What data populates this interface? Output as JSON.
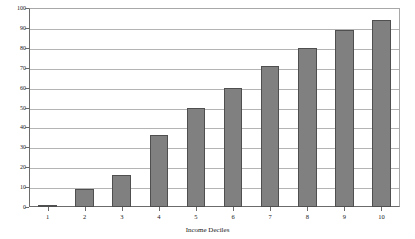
{
  "chart_data": {
    "type": "bar",
    "title": "",
    "subtitle": "",
    "xlabel": "Income Deciles",
    "ylabel": "",
    "categories": [
      "1",
      "2",
      "3",
      "4",
      "5",
      "6",
      "7",
      "8",
      "9",
      "10"
    ],
    "values": [
      1,
      9,
      16,
      36,
      50,
      60,
      71,
      80,
      89,
      94
    ],
    "series": [
      {
        "name": "",
        "values": [
          1,
          9,
          16,
          36,
          50,
          60,
          71,
          80,
          89,
          94
        ]
      }
    ],
    "ylim": [
      0,
      100
    ],
    "y_ticks": [
      0,
      10,
      20,
      30,
      40,
      50,
      60,
      70,
      80,
      90,
      100
    ],
    "y_tick_labels": [
      "0",
      "10",
      "20",
      "30",
      "40",
      "50",
      "60",
      "70",
      "80",
      "90",
      "100"
    ],
    "x_tick_labels": [
      "1",
      "2",
      "3",
      "4",
      "5",
      "6",
      "7",
      "8",
      "9",
      "10"
    ],
    "grid": true,
    "grid_axis": "y",
    "legend": false,
    "legend_position": "none",
    "annotations": [],
    "colors": {
      "bar_fill": "#808080",
      "bar_border": "#4f4f4f",
      "gridline": "#b4b4b4",
      "axis": "#6b6b6b",
      "frame": "#a8a8a8",
      "background": "#ffffff",
      "text": "#202020"
    }
  }
}
